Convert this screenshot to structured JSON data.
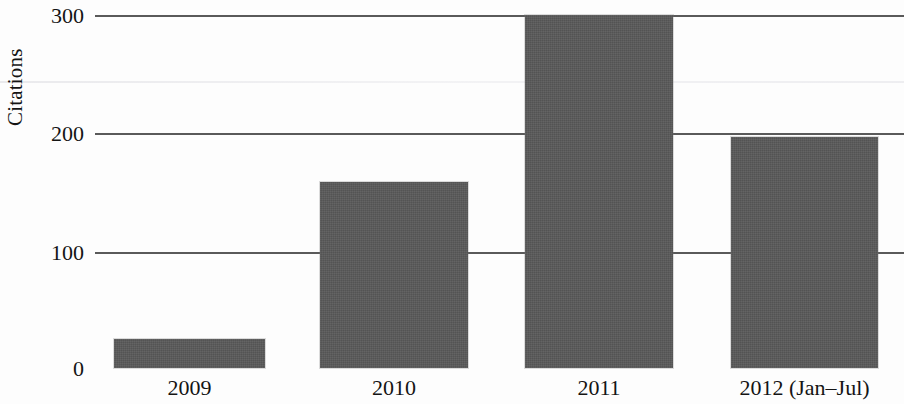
{
  "chart_data": {
    "type": "bar",
    "title": "",
    "subtitle": "",
    "xlabel": "",
    "ylabel": "Citations",
    "categories": [
      "2009",
      "2010",
      "2011",
      "2012 (Jan–Jul)"
    ],
    "values": [
      25,
      158,
      300,
      196
    ],
    "series": [
      {
        "name": "Citations",
        "values": [
          25,
          158,
          300,
          196
        ],
        "color": "#595959"
      }
    ],
    "ylim": [
      0,
      300
    ],
    "xlim": [
      0,
      4
    ],
    "y_ticks": [
      0,
      100,
      200,
      300
    ],
    "y_tick_labels": [
      "0",
      "100",
      "200",
      "300"
    ],
    "grid": "horizontal",
    "legend": "none",
    "annotations": [],
    "bar_color": "#595959",
    "gridline_color": "#5a5a5a",
    "background_color": "#fdfdfd"
  },
  "axes": {
    "y_title": "Citations",
    "y_ticks": [
      {
        "label": "300",
        "value": 300
      },
      {
        "label": "200",
        "value": 200
      },
      {
        "label": "100",
        "value": 100
      },
      {
        "label": "0",
        "value": 0
      }
    ],
    "x_ticks": [
      {
        "label": "2009"
      },
      {
        "label": "2010"
      },
      {
        "label": "2011"
      },
      {
        "label": "2012 (Jan–Jul)"
      }
    ]
  },
  "bars": [
    {
      "category": "2009",
      "value": 25
    },
    {
      "category": "2010",
      "value": 158
    },
    {
      "category": "2011",
      "value": 300
    },
    {
      "category": "2012 (Jan–Jul)",
      "value": 196
    }
  ]
}
